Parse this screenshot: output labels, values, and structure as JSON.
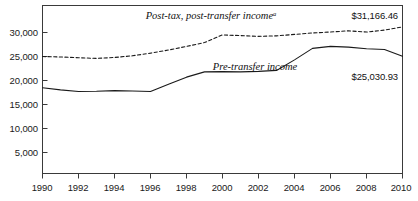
{
  "chart_data": {
    "type": "line",
    "title": "",
    "xlabel": "",
    "ylabel": "",
    "xlim": [
      1990,
      2010
    ],
    "ylim": [
      0,
      32500
    ],
    "grid": false,
    "legend_position": "inline-annotation",
    "x": [
      1990,
      1991,
      1992,
      1993,
      1994,
      1995,
      1996,
      1997,
      1998,
      1999,
      2000,
      2001,
      2002,
      2003,
      2004,
      2005,
      2006,
      2007,
      2008,
      2009,
      2010
    ],
    "ytick_labels": [
      "5,000",
      "10,000",
      "15,000",
      "20,000",
      "25,000",
      "30,000"
    ],
    "ytick_values": [
      5000,
      10000,
      15000,
      20000,
      25000,
      30000
    ],
    "xtick_labels": [
      "1990",
      "1992",
      "1994",
      "1996",
      "1998",
      "2000",
      "2002",
      "2004",
      "2006",
      "2008",
      "2010"
    ],
    "xtick_values": [
      1990,
      1992,
      1994,
      1996,
      1998,
      2000,
      2002,
      2004,
      2006,
      2008,
      2010
    ],
    "series": [
      {
        "name": "Post-tax, post-transfer income",
        "style": "dashed",
        "color": "#1a1a1a",
        "label_text": "Post-tax, post-transfer income",
        "label_superscript": "a",
        "end_value_label": "$31,166.46",
        "values": [
          25000,
          24900,
          24750,
          24600,
          24800,
          25150,
          25700,
          26350,
          27100,
          27900,
          29500,
          29350,
          29200,
          29300,
          29600,
          29900,
          30100,
          30350,
          30100,
          30500,
          31166.46
        ]
      },
      {
        "name": "Pre-transfer income",
        "style": "solid",
        "color": "#1a1a1a",
        "label_text": "Pre-transfer income",
        "end_value_label": "$25,030.93",
        "values": [
          18500,
          18050,
          17700,
          17750,
          17900,
          17800,
          17700,
          19200,
          20700,
          21800,
          21850,
          21800,
          21900,
          22100,
          24300,
          26700,
          27100,
          26950,
          26600,
          26450,
          25030.93
        ]
      }
    ],
    "annotations": [
      {
        "id": "post-tax-series-label",
        "text": "Post-tax, post-transfer income",
        "superscript": "a"
      },
      {
        "id": "pre-transfer-series-label",
        "text": "Pre-transfer income"
      },
      {
        "id": "post-tax-end-value",
        "text": "$31,166.46"
      },
      {
        "id": "pre-transfer-end-value",
        "text": "$25,030.93"
      }
    ]
  },
  "axis": {
    "y0_label": "5,000",
    "y1_label": "10,000",
    "y2_label": "15,000",
    "y3_label": "20,000",
    "y4_label": "25,000",
    "y5_label": "30,000",
    "x0_label": "1990",
    "x1_label": "1992",
    "x2_label": "1994",
    "x3_label": "1996",
    "x4_label": "1998",
    "x5_label": "2000",
    "x6_label": "2002",
    "x7_label": "2004",
    "x8_label": "2006",
    "x9_label": "2008",
    "x10_label": "2010"
  },
  "colors": {
    "axis": "#3a3a3a",
    "series": "#1a1a1a",
    "background": "#ffffff"
  }
}
